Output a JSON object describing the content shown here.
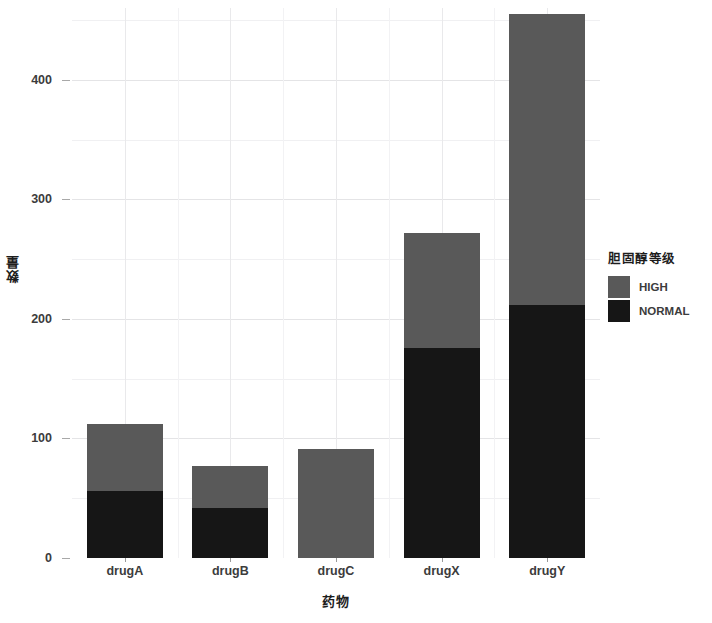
{
  "chart_data": {
    "type": "bar",
    "stacked": true,
    "title": "",
    "xlabel": "药物",
    "ylabel": "数量",
    "categories": [
      "drugA",
      "drugB",
      "drugC",
      "drugX",
      "drugY"
    ],
    "series": [
      {
        "name": "HIGH",
        "color": "#595959",
        "values": [
          56,
          35,
          91,
          96,
          243
        ]
      },
      {
        "name": "NORMAL",
        "color": "#161616",
        "values": [
          56,
          42,
          0,
          176,
          212
        ]
      }
    ],
    "stack_order_bottom_to_top": [
      "NORMAL",
      "HIGH"
    ],
    "totals": [
      112,
      77,
      91,
      272,
      455
    ],
    "ylim": [
      0,
      460
    ],
    "yticks": [
      0,
      100,
      200,
      300,
      400
    ],
    "ytick_labels": [
      "0",
      "100",
      "200",
      "300",
      "400"
    ],
    "yticks_minor": [
      50,
      150,
      250,
      350,
      450
    ],
    "grid": true,
    "grid_color": "#e4e4e6",
    "panel_background": "#ffffff",
    "legend": {
      "title": "胆固醇等级",
      "position": "right",
      "entries": [
        {
          "label": "HIGH",
          "color": "#595959"
        },
        {
          "label": "NORMAL",
          "color": "#161616"
        }
      ]
    }
  }
}
